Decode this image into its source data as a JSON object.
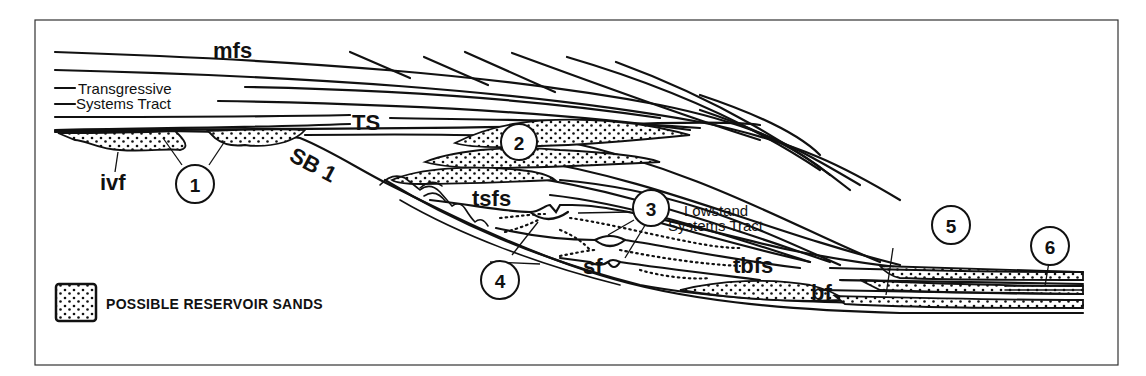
{
  "diagram": {
    "labels": {
      "mfs": "mfs",
      "transgressive_line1": "Transgressive",
      "transgressive_line2": "Systems Tract",
      "ts": "TS",
      "sb1": "SB 1",
      "ivf": "ivf",
      "tsfs": "tsfs",
      "lowstand_line1": "Lowstand",
      "lowstand_line2": "Systems Tract",
      "sf": "sf",
      "tbfs": "tbfs",
      "bf": "bf"
    },
    "callouts": [
      {
        "number": "1",
        "target": "incised valley fill sands"
      },
      {
        "number": "2",
        "target": "transgressive sand lenses"
      },
      {
        "number": "3",
        "target": "channel scours in lowstand tract"
      },
      {
        "number": "4",
        "target": "slope fan dotted sands"
      },
      {
        "number": "5",
        "target": "basin floor fan"
      },
      {
        "number": "6",
        "target": "distal condensed sands"
      }
    ],
    "legend": {
      "swatch": "stippled-sand-pattern",
      "label": "POSSIBLE RESERVOIR SANDS"
    },
    "colors": {
      "ink": "#111111",
      "background": "#ffffff",
      "frame": "#333333"
    }
  }
}
